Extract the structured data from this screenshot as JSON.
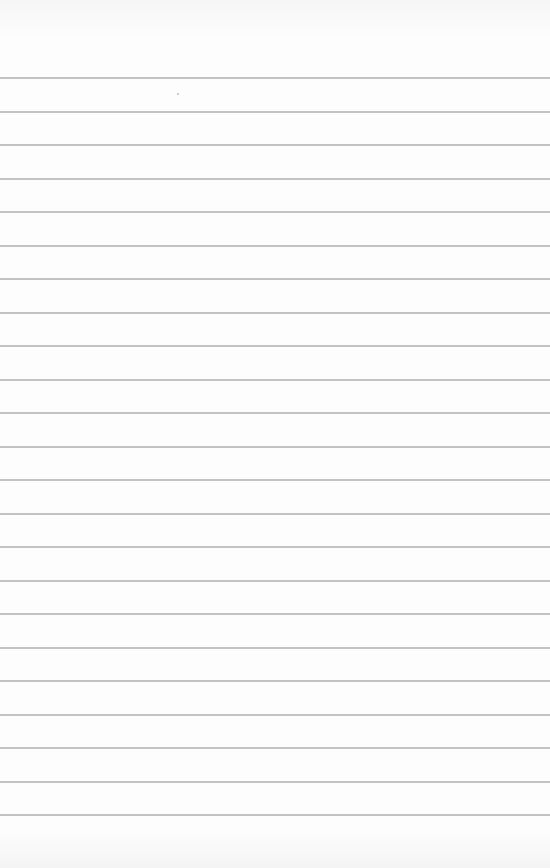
{
  "page": {
    "type": "lined-paper",
    "background_color": "#fdfdfd",
    "rule_color": "#b9b9b9",
    "rule_count": 23,
    "first_rule_y": 77,
    "rule_spacing": 33.5
  }
}
